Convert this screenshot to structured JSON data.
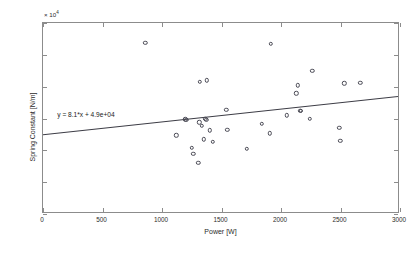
{
  "chart_data": {
    "type": "scatter",
    "title": "",
    "xlabel": "Power [W]",
    "ylabel": "Spring Constant [N/m]",
    "xlim": [
      0,
      3000
    ],
    "ylim": [
      0,
      120000
    ],
    "y_exponent_label": "× 10",
    "y_exponent_power": "4",
    "grid": false,
    "legend": null,
    "xticks": [
      0,
      500,
      1000,
      1500,
      2000,
      2500,
      3000
    ],
    "xtick_labels": [
      "0",
      "500",
      "1000",
      "1500",
      "2000",
      "2500",
      "3000"
    ],
    "yticks": [
      0,
      20000,
      40000,
      60000,
      80000,
      100000,
      120000
    ],
    "ytick_labels": [
      "0",
      "2",
      "4",
      "6",
      "8",
      "10",
      "12"
    ],
    "annotation": "y = 8.1*x + 4.9e+04",
    "annotation_x": 120,
    "annotation_y": 62000,
    "fit": {
      "slope": 8.1,
      "intercept": 49000,
      "x_start": 0,
      "x_end": 3000,
      "y_start": 49000,
      "y_end": 73300,
      "color": "#3d3d46"
    },
    "marker": {
      "shape": "open-circle",
      "edge_color": "#4a4a55",
      "face_color": "none",
      "size_px": 4.4
    },
    "points": [
      {
        "x": 860,
        "y": 107500
      },
      {
        "x": 1120,
        "y": 49500
      },
      {
        "x": 1195,
        "y": 59500
      },
      {
        "x": 1205,
        "y": 59000
      },
      {
        "x": 1250,
        "y": 41500
      },
      {
        "x": 1262,
        "y": 38000
      },
      {
        "x": 1305,
        "y": 32000
      },
      {
        "x": 1312,
        "y": 57500
      },
      {
        "x": 1318,
        "y": 83000
      },
      {
        "x": 1335,
        "y": 55500
      },
      {
        "x": 1352,
        "y": 47000
      },
      {
        "x": 1365,
        "y": 59800
      },
      {
        "x": 1372,
        "y": 59300
      },
      {
        "x": 1378,
        "y": 84000
      },
      {
        "x": 1400,
        "y": 52500
      },
      {
        "x": 1428,
        "y": 45500
      },
      {
        "x": 1540,
        "y": 65500
      },
      {
        "x": 1548,
        "y": 53000
      },
      {
        "x": 1712,
        "y": 41000
      },
      {
        "x": 1840,
        "y": 56500
      },
      {
        "x": 1905,
        "y": 50800
      },
      {
        "x": 1912,
        "y": 106800
      },
      {
        "x": 2050,
        "y": 62000
      },
      {
        "x": 2128,
        "y": 75800
      },
      {
        "x": 2140,
        "y": 80800
      },
      {
        "x": 2162,
        "y": 64800
      },
      {
        "x": 2168,
        "y": 65000
      },
      {
        "x": 2240,
        "y": 60000
      },
      {
        "x": 2262,
        "y": 90000
      },
      {
        "x": 2490,
        "y": 54000
      },
      {
        "x": 2498,
        "y": 45800
      },
      {
        "x": 2532,
        "y": 82000
      },
      {
        "x": 2668,
        "y": 82300
      }
    ]
  }
}
